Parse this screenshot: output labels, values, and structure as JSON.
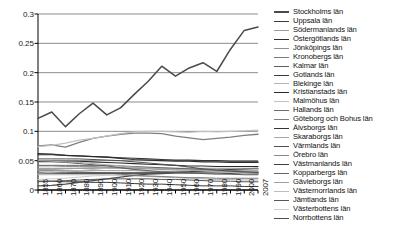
{
  "chart_data": {
    "type": "line",
    "title": "",
    "xlabel": "",
    "ylabel": "",
    "ylim": [
      0,
      0.3
    ],
    "yticks": [
      0,
      0.05,
      0.1,
      0.15,
      0.2,
      0.25,
      0.3
    ],
    "ytick_labels": [
      "0",
      "0.05",
      "0.1",
      "0.15",
      "0.2",
      "0.25",
      "0.3"
    ],
    "grid": true,
    "grid_axis": "y",
    "legend_position": "right",
    "x": [
      1855,
      1860,
      1870,
      1880,
      1890,
      1900,
      1910,
      1920,
      1930,
      1940,
      1950,
      1960,
      1970,
      1980,
      1990,
      2000,
      2007
    ],
    "xtick_labels": [
      "1855",
      "1860",
      "1870",
      "1880",
      "1890",
      "1900",
      "1910",
      "1920",
      "1930",
      "1940",
      "1950",
      "1960",
      "1970",
      "1980",
      "1990",
      "2000",
      "2007"
    ],
    "series": [
      {
        "name": "Stockholms län",
        "color": "#4a4a4a",
        "width": 1.5,
        "values": [
          0.122,
          0.133,
          0.108,
          0.13,
          0.148,
          0.128,
          0.14,
          0.163,
          0.185,
          0.211,
          0.194,
          0.208,
          0.217,
          0.202,
          0.24,
          0.272,
          0.278
        ]
      },
      {
        "name": "Uppsala län",
        "color": "#3c3c3c",
        "width": 1.1,
        "values": [
          0.03,
          0.03,
          0.029,
          0.029,
          0.029,
          0.029,
          0.029,
          0.029,
          0.029,
          0.029,
          0.03,
          0.031,
          0.033,
          0.034,
          0.035,
          0.036,
          0.037
        ]
      },
      {
        "name": "Södermanlands län",
        "color": "#9b9b9b",
        "width": 1.0,
        "values": [
          0.034,
          0.034,
          0.033,
          0.033,
          0.033,
          0.033,
          0.033,
          0.033,
          0.032,
          0.032,
          0.031,
          0.031,
          0.031,
          0.03,
          0.03,
          0.029,
          0.029
        ]
      },
      {
        "name": "Östergötlands län",
        "color": "#2e2e2e",
        "width": 1.2,
        "values": [
          0.062,
          0.061,
          0.059,
          0.058,
          0.057,
          0.056,
          0.054,
          0.052,
          0.051,
          0.05,
          0.049,
          0.049,
          0.048,
          0.048,
          0.047,
          0.047,
          0.047
        ]
      },
      {
        "name": "Jönköpings län",
        "color": "#8f8f8f",
        "width": 1.0,
        "values": [
          0.041,
          0.041,
          0.04,
          0.04,
          0.04,
          0.039,
          0.038,
          0.037,
          0.037,
          0.037,
          0.037,
          0.037,
          0.037,
          0.037,
          0.037,
          0.037,
          0.037
        ]
      },
      {
        "name": "Kronobergs län",
        "color": "#7a7a7a",
        "width": 1.0,
        "values": [
          0.033,
          0.033,
          0.032,
          0.031,
          0.03,
          0.029,
          0.027,
          0.025,
          0.024,
          0.023,
          0.022,
          0.021,
          0.021,
          0.02,
          0.02,
          0.02,
          0.02
        ]
      },
      {
        "name": "Kalmar län",
        "color": "#5d5d5d",
        "width": 1.0,
        "values": [
          0.048,
          0.048,
          0.047,
          0.045,
          0.043,
          0.041,
          0.038,
          0.035,
          0.033,
          0.031,
          0.03,
          0.029,
          0.028,
          0.027,
          0.027,
          0.026,
          0.026
        ]
      },
      {
        "name": "Gotlands län",
        "color": "#3a3a3a",
        "width": 1.0,
        "values": [
          0.015,
          0.015,
          0.014,
          0.014,
          0.013,
          0.013,
          0.012,
          0.011,
          0.01,
          0.01,
          0.009,
          0.008,
          0.007,
          0.007,
          0.007,
          0.006,
          0.006
        ]
      },
      {
        "name": "Blekinge län",
        "color": "#b4b4b4",
        "width": 1.0,
        "values": [
          0.026,
          0.026,
          0.026,
          0.026,
          0.026,
          0.026,
          0.025,
          0.024,
          0.023,
          0.022,
          0.021,
          0.02,
          0.019,
          0.018,
          0.018,
          0.017,
          0.017
        ]
      },
      {
        "name": "Kristianstads län",
        "color": "#2a2a2a",
        "width": 1.1,
        "values": [
          0.049,
          0.049,
          0.049,
          0.049,
          0.048,
          0.047,
          0.046,
          0.045,
          0.044,
          0.043,
          0.042,
          0.041,
          0.041,
          0.04,
          0.04,
          0.04,
          0.04
        ]
      },
      {
        "name": "Malmöhus län",
        "color": "#c2c2c2",
        "width": 1.2,
        "values": [
          0.074,
          0.076,
          0.08,
          0.085,
          0.088,
          0.092,
          0.096,
          0.099,
          0.1,
          0.1,
          0.099,
          0.098,
          0.1,
          0.099,
          0.1,
          0.101,
          0.102
        ]
      },
      {
        "name": "Hallands län",
        "color": "#6e6e6e",
        "width": 1.0,
        "values": [
          0.028,
          0.028,
          0.028,
          0.028,
          0.028,
          0.028,
          0.028,
          0.028,
          0.029,
          0.029,
          0.029,
          0.03,
          0.031,
          0.032,
          0.033,
          0.034,
          0.034
        ]
      },
      {
        "name": "Göteborg och Bohus län",
        "color": "#7f7f7f",
        "width": 1.3,
        "values": [
          0.075,
          0.077,
          0.073,
          0.081,
          0.088,
          0.092,
          0.095,
          0.097,
          0.097,
          0.096,
          0.092,
          0.089,
          0.086,
          0.088,
          0.09,
          0.093,
          0.095
        ]
      },
      {
        "name": "Älvsborgs län",
        "color": "#343434",
        "width": 1.1,
        "values": [
          0.06,
          0.06,
          0.059,
          0.058,
          0.057,
          0.056,
          0.055,
          0.054,
          0.053,
          0.052,
          0.051,
          0.051,
          0.05,
          0.05,
          0.049,
          0.049,
          0.049
        ]
      },
      {
        "name": "Skaraborgs län",
        "color": "#a8a8a8",
        "width": 1.0,
        "values": [
          0.05,
          0.049,
          0.048,
          0.047,
          0.045,
          0.043,
          0.041,
          0.039,
          0.037,
          0.036,
          0.035,
          0.034,
          0.033,
          0.032,
          0.032,
          0.031,
          0.031
        ]
      },
      {
        "name": "Värmlands län",
        "color": "#4f4f4f",
        "width": 1.0,
        "values": [
          0.053,
          0.053,
          0.053,
          0.053,
          0.052,
          0.051,
          0.05,
          0.048,
          0.046,
          0.044,
          0.042,
          0.039,
          0.036,
          0.034,
          0.032,
          0.031,
          0.03
        ]
      },
      {
        "name": "Örebro län",
        "color": "#898989",
        "width": 1.0,
        "values": [
          0.037,
          0.037,
          0.037,
          0.037,
          0.037,
          0.037,
          0.037,
          0.036,
          0.036,
          0.035,
          0.034,
          0.034,
          0.033,
          0.032,
          0.032,
          0.031,
          0.031
        ]
      },
      {
        "name": "Västmanlands län",
        "color": "#3f3f3f",
        "width": 1.0,
        "values": [
          0.029,
          0.029,
          0.029,
          0.029,
          0.029,
          0.029,
          0.029,
          0.029,
          0.029,
          0.029,
          0.03,
          0.031,
          0.031,
          0.03,
          0.03,
          0.029,
          0.029
        ]
      },
      {
        "name": "Kopparbergs län",
        "color": "#666666",
        "width": 1.0,
        "values": [
          0.042,
          0.042,
          0.042,
          0.042,
          0.042,
          0.042,
          0.041,
          0.04,
          0.039,
          0.038,
          0.037,
          0.036,
          0.035,
          0.033,
          0.032,
          0.031,
          0.03
        ]
      },
      {
        "name": "Gävleborgs län",
        "color": "#9e9e9e",
        "width": 1.0,
        "values": [
          0.035,
          0.035,
          0.036,
          0.037,
          0.038,
          0.038,
          0.038,
          0.038,
          0.037,
          0.037,
          0.036,
          0.035,
          0.034,
          0.033,
          0.032,
          0.031,
          0.03
        ]
      },
      {
        "name": "Västernorrlands län",
        "color": "#bcbcbc",
        "width": 1.0,
        "values": [
          0.029,
          0.03,
          0.031,
          0.033,
          0.035,
          0.037,
          0.038,
          0.038,
          0.038,
          0.037,
          0.036,
          0.034,
          0.033,
          0.031,
          0.03,
          0.028,
          0.027
        ]
      },
      {
        "name": "Jämtlands län",
        "color": "#575757",
        "width": 1.0,
        "values": [
          0.014,
          0.015,
          0.016,
          0.017,
          0.018,
          0.019,
          0.019,
          0.019,
          0.019,
          0.018,
          0.018,
          0.017,
          0.016,
          0.015,
          0.015,
          0.014,
          0.014
        ]
      },
      {
        "name": "Västerbottens län",
        "color": "#cccccc",
        "width": 1.0,
        "values": [
          0.018,
          0.019,
          0.02,
          0.022,
          0.024,
          0.025,
          0.026,
          0.027,
          0.028,
          0.028,
          0.028,
          0.028,
          0.028,
          0.028,
          0.028,
          0.029,
          0.029
        ]
      },
      {
        "name": "Norrbottens län",
        "color": "#4c4c4c",
        "width": 1.2,
        "values": [
          0.007,
          0.008,
          0.01,
          0.013,
          0.016,
          0.019,
          0.022,
          0.025,
          0.027,
          0.028,
          0.029,
          0.029,
          0.029,
          0.029,
          0.028,
          0.028,
          0.028
        ]
      }
    ]
  }
}
